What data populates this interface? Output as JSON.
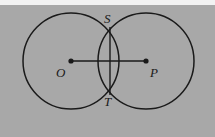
{
  "figure": {
    "kind": "geometry-diagram",
    "width": 215,
    "height": 137,
    "background_color": "#a8a8a8",
    "top_band_color": "#f2f2f2",
    "stroke_color": "#1a1a1a",
    "label_color": "#1a1a1a"
  },
  "chart_data": {
    "type": "diagram",
    "circles": [
      {
        "name": "circle-O",
        "cx": 71,
        "cy": 61,
        "r": 48
      },
      {
        "name": "circle-P",
        "cx": 146,
        "cy": 61,
        "r": 48
      }
    ],
    "points": [
      {
        "label": "O",
        "x": 71,
        "y": 61,
        "role": "center-left",
        "dot": true
      },
      {
        "label": "P",
        "x": 146,
        "y": 61,
        "role": "center-right",
        "dot": true
      },
      {
        "label": "S",
        "x": 110,
        "y": 27,
        "role": "intersection-upper",
        "dot": false
      },
      {
        "label": "T",
        "x": 110,
        "y": 95,
        "role": "intersection-lower",
        "dot": false
      }
    ],
    "segments": [
      {
        "name": "segment-OP",
        "from": "O",
        "to": "P",
        "x1": 71,
        "y1": 61,
        "x2": 146,
        "y2": 61
      },
      {
        "name": "chord-ST",
        "from": "S",
        "to": "T",
        "x1": 110,
        "y1": 27,
        "x2": 110,
        "y2": 95
      }
    ],
    "grid": false,
    "legend": false
  },
  "labels": {
    "O": "O",
    "P": "P",
    "S": "S",
    "T": "T"
  }
}
